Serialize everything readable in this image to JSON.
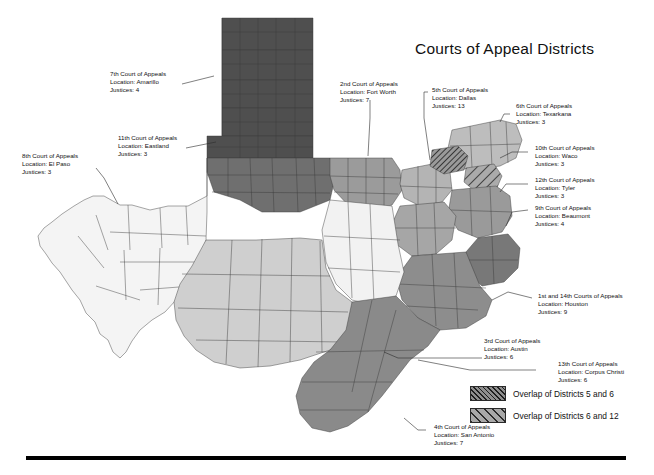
{
  "page": {
    "title": "Courts of Appeal Districts",
    "background": "#ffffff",
    "width": 654,
    "height": 475
  },
  "map": {
    "name": "texas-courts-of-appeal-districts",
    "state": "Texas",
    "outline_color": "#3a3a3a",
    "district_shades": {
      "d1_14_houston": "#8d8d8d",
      "d2_fort_worth": "#9b9b9b",
      "d3_austin": "#f2f2f2",
      "d4_san_antonio": "#cfcfcf",
      "d5_dallas": "#b4b4b4",
      "d6_texarkana": "#bdbdbd",
      "d7_amarillo": "#4f4f4f",
      "d8_el_paso": "#f4f4f4",
      "d9_beaumont": "#787878",
      "d10_waco": "#a6a6a6",
      "d11_eastland": "#6f6f6f",
      "d12_tyler": "#9a9a9a",
      "d13_corpus_christi": "#8a8a8a"
    }
  },
  "callouts": [
    {
      "id": "d7",
      "court": "7th Court of Appeals",
      "location": "Location: Amarillo",
      "justices": "Justices: 4"
    },
    {
      "id": "d11",
      "court": "11th Court of Appeals",
      "location": "Location: Eastland",
      "justices": "Justices: 3"
    },
    {
      "id": "d8",
      "court": "8th Court of Appeals",
      "location": "Location: El Paso",
      "justices": "Justices: 3"
    },
    {
      "id": "d2",
      "court": "2nd Court of Appeals",
      "location": "Location: Fort Worth",
      "justices": "Justices: 7"
    },
    {
      "id": "d5",
      "court": "5th Court of Appeals",
      "location": "Location: Dallas",
      "justices": "Justices: 13"
    },
    {
      "id": "d6",
      "court": "6th Court of Appeals",
      "location": "Location: Texarkana",
      "justices": "Justices: 3"
    },
    {
      "id": "d10",
      "court": "10th Court of Appeals",
      "location": "Location: Waco",
      "justices": "Justices: 3"
    },
    {
      "id": "d12",
      "court": "12th Court of Appeals",
      "location": "Location: Tyler",
      "justices": "Justices: 3"
    },
    {
      "id": "d9",
      "court": "9th Court of Appeals",
      "location": "Location: Beaumont",
      "justices": "Justices: 4"
    },
    {
      "id": "d1_14",
      "court": "1st and 14th Courts of Appeals",
      "location": "Location: Houston",
      "justices": "Justices: 9"
    },
    {
      "id": "d3",
      "court": "3rd Court of Appeals",
      "location": "Location: Austin",
      "justices": "Justices: 6"
    },
    {
      "id": "d13",
      "court": "13th Court of Appeals",
      "location": "Location: Corpus Christi",
      "justices": "Justices: 6"
    },
    {
      "id": "d4",
      "court": "4th Court of Appeals",
      "location": "Location: San Antonio",
      "justices": "Justices: 7"
    }
  ],
  "legend": {
    "items": [
      {
        "pattern": "dense-diagonal-hatch",
        "label": "Overlap of Districts 5 and 6"
      },
      {
        "pattern": "wide-diagonal-hatch",
        "label": "Overlap of Districts 6 and 12"
      }
    ]
  }
}
